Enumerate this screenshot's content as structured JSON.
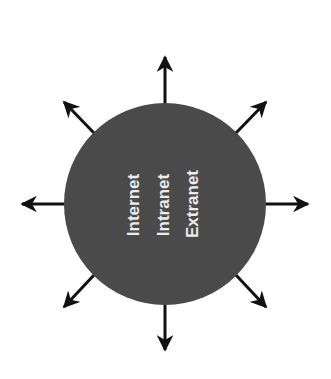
{
  "diagram": {
    "labels": [
      "Internet",
      "Intranet",
      "Extranet"
    ],
    "colors": {
      "circle": "#4a4a4a",
      "arrow": "#111111",
      "text": "#ececec",
      "background": "#ffffff"
    },
    "arrows": [
      "up",
      "up-right",
      "right",
      "down-right",
      "down",
      "down-left",
      "left",
      "up-left"
    ]
  }
}
